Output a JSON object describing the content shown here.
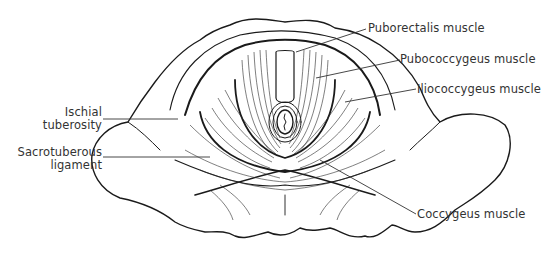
{
  "diagram": {
    "type": "anatomical illustration",
    "labels": {
      "puborectalis": "Puborectalis muscle",
      "pubococcygeus": "Pubococcygeus muscle",
      "iliococcygeus": "Iliococcygeus muscle",
      "ischial_line1": "Ischial",
      "ischial_line2": "tuberosity",
      "sacro_line1": "Sacrotuberous",
      "sacro_line2": "ligament",
      "coccygeus": "Coccygeus muscle"
    },
    "colors": {
      "ink": "#1a1a1a",
      "label": "#333333",
      "background": "#ffffff"
    }
  }
}
